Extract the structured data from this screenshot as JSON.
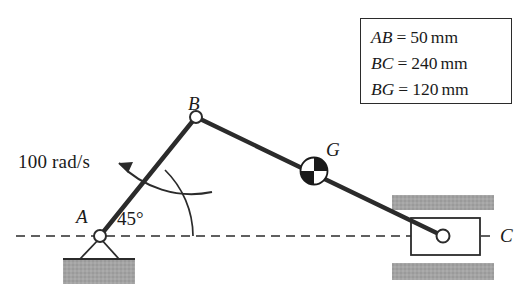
{
  "figure": {
    "colors": {
      "line": "#2b2b2b",
      "ground_fill": "#a0a0a0",
      "joint_fill": "#ffffff",
      "background": "#ffffff"
    }
  },
  "labels": {
    "point_a": "A",
    "point_b": "B",
    "point_g": "G",
    "point_c": "C",
    "angular_velocity": "100 rad/s",
    "angle": "45°"
  },
  "dimensions": [
    {
      "symbol": "AB",
      "equals": "=",
      "value": "50",
      "unit": "mm"
    },
    {
      "symbol": "BC",
      "equals": "=",
      "value": "240",
      "unit": "mm"
    },
    {
      "symbol": "BG",
      "equals": "=",
      "value": "120",
      "unit": "mm"
    }
  ],
  "icons": {
    "pin_support": "pin-support-icon",
    "slider_block": "slider-block-icon",
    "mass_center": "center-of-mass-icon",
    "rotation_arrow": "curved-rotation-arrow-icon",
    "centerline": "dashed-centerline-icon"
  }
}
